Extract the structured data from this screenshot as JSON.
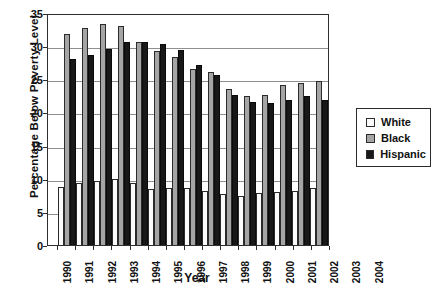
{
  "chart_data": {
    "type": "bar",
    "title": "",
    "xlabel": "Year",
    "ylabel": "Percentage Below Poverty Level",
    "ylim": [
      0,
      35
    ],
    "ytick_step": 5,
    "grid": true,
    "legend_position": "right",
    "categories": [
      "1990",
      "1991",
      "1992",
      "1993",
      "1994",
      "1995",
      "1996",
      "1997",
      "1998",
      "1999",
      "2000",
      "2001",
      "2002",
      "2003",
      "2004"
    ],
    "series": [
      {
        "name": "White",
        "color": "#fbfbfb",
        "values": [
          8.8,
          9.4,
          9.6,
          9.9,
          9.4,
          8.5,
          8.6,
          8.6,
          8.2,
          7.7,
          7.4,
          7.8,
          8.0,
          8.2,
          8.6
        ]
      },
      {
        "name": "Black",
        "color": "#a5a5a5",
        "values": [
          31.9,
          32.7,
          33.4,
          33.1,
          30.6,
          29.3,
          28.4,
          26.5,
          26.1,
          23.6,
          22.5,
          22.7,
          24.1,
          24.4,
          24.7
        ]
      },
      {
        "name": "Hispanic",
        "color": "#181818",
        "values": [
          28.1,
          28.7,
          29.6,
          30.6,
          30.7,
          30.3,
          29.4,
          27.1,
          25.6,
          22.7,
          21.5,
          21.4,
          21.8,
          22.5,
          21.9
        ]
      }
    ]
  }
}
